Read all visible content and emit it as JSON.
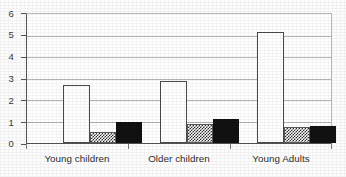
{
  "chart_data": {
    "type": "bar",
    "title": "",
    "subtitle": "",
    "xlabel": "",
    "ylabel": "",
    "categories": [
      "Young children",
      "Older children",
      "Young Adults"
    ],
    "series": [
      {
        "name": "white",
        "fill": "white",
        "values": [
          2.7,
          2.9,
          5.15
        ]
      },
      {
        "name": "hatched",
        "fill": "checkered-gray",
        "values": [
          0.5,
          0.9,
          0.75
        ]
      },
      {
        "name": "black",
        "fill": "solid-black",
        "values": [
          1.0,
          1.1,
          0.8
        ]
      }
    ],
    "ylim": [
      0,
      6
    ],
    "yticks": [
      0,
      1,
      2,
      3,
      4,
      5,
      6
    ],
    "ytick_labels": [
      "0",
      "1",
      "2",
      "3",
      "4",
      "5",
      "6"
    ],
    "grid": true,
    "grid_axis": "y",
    "legend": false,
    "legend_position": "none"
  },
  "axes": {
    "y_labels": [
      "6",
      "5",
      "4",
      "3",
      "2",
      "1",
      "0"
    ],
    "x_labels": [
      "Young children",
      "Older children",
      "Young Adults"
    ]
  },
  "colors": {
    "background": "#ffffff",
    "gridline": "#b5b5b5",
    "axis": "#555555",
    "bar_white_fill": "#ffffff",
    "bar_white_stroke": "#4a4a4a",
    "bar_hatch_ink": "#2a2a2a",
    "bar_black_fill": "#111111",
    "text": "#2f2f2f"
  }
}
